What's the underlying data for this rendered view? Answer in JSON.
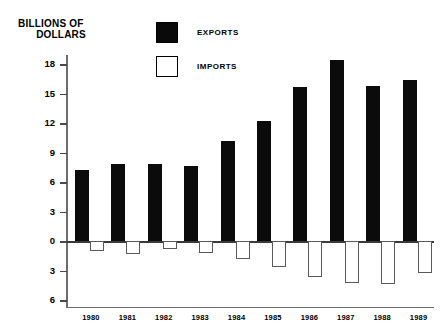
{
  "chart": {
    "title_line1": "BILLIONS OF",
    "title_line2": "DOLLARS"
  },
  "legend": {
    "items": [
      {
        "label": "EXPORTS",
        "style": "filled",
        "color": "#0b0b0b"
      },
      {
        "label": "IMPORTS",
        "style": "hollow",
        "color": "#ffffff"
      }
    ]
  },
  "axis": {
    "y_ticks": [
      "18",
      "15",
      "12",
      "9",
      "6",
      "3",
      "0",
      "3",
      "6"
    ],
    "x_labels": [
      "1980",
      "1981",
      "1982",
      "1983",
      "1984",
      "1985",
      "1986",
      "1987",
      "1988",
      "1989"
    ]
  },
  "chart_data": {
    "type": "bar",
    "title": "BILLIONS OF DOLLARS",
    "xlabel": "",
    "ylabel": "BILLIONS OF DOLLARS",
    "ylim": [
      -6,
      19.5
    ],
    "yticks": [
      18,
      15,
      12,
      9,
      6,
      3,
      0,
      -3,
      -6
    ],
    "ytick_labels": [
      "18",
      "15",
      "12",
      "9",
      "6",
      "3",
      "0",
      "3",
      "6"
    ],
    "grid": false,
    "legend_position": "top-center",
    "categories": [
      "1980",
      "1981",
      "1982",
      "1983",
      "1984",
      "1985",
      "1986",
      "1987",
      "1988",
      "1989"
    ],
    "series": [
      {
        "name": "EXPORTS",
        "color": "#0b0b0b",
        "values": [
          7.2,
          7.8,
          7.8,
          7.6,
          10.2,
          12.2,
          15.7,
          18.4,
          15.8,
          16.4
        ]
      },
      {
        "name": "IMPORTS",
        "color": "#ffffff",
        "values": [
          -1.0,
          -1.3,
          -0.8,
          -1.2,
          -1.8,
          -2.6,
          -3.7,
          -4.3,
          -4.4,
          -3.2
        ]
      }
    ]
  }
}
